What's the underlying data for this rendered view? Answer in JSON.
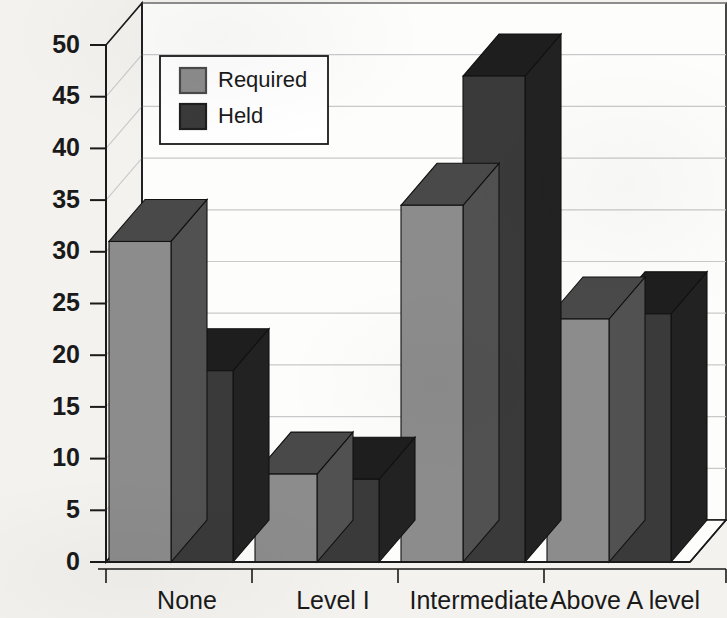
{
  "chart_data": {
    "type": "bar",
    "title": "",
    "subtitle": "",
    "xlabel": "",
    "ylabel": "",
    "categories": [
      "None",
      "Level I",
      "Intermediate",
      "Above A level"
    ],
    "series": [
      {
        "name": "Required",
        "values": [
          31,
          8.5,
          34.5,
          23.5
        ],
        "color": "#8c8c8c"
      },
      {
        "name": "Held",
        "values": [
          18.5,
          8,
          47,
          24
        ],
        "color": "#3a3a3a"
      }
    ],
    "ylim": [
      0,
      50
    ],
    "yticks": [
      0,
      5,
      10,
      15,
      20,
      25,
      30,
      35,
      40,
      45,
      50
    ],
    "ytick_labels": [
      "0",
      "5",
      "10",
      "15",
      "20",
      "25",
      "30",
      "35",
      "40",
      "45",
      "50"
    ],
    "grid": true,
    "grid_axis": "y",
    "legend_position": "upper left",
    "style": "3d-bar",
    "annotations": []
  },
  "legend": {
    "entries": [
      {
        "label": "Required",
        "swatch_face": "#8c8c8c",
        "swatch_edge": "#4a4a4a"
      },
      {
        "label": "Held",
        "swatch_face": "#3a3a3a",
        "swatch_edge": "#1e1e1e"
      }
    ]
  },
  "axes": {
    "y_ticks": [
      "50",
      "45",
      "40",
      "35",
      "30",
      "25",
      "20",
      "15",
      "10",
      "5",
      "0"
    ],
    "x_categories": [
      "None",
      "Level I",
      "Intermediate",
      "Above A level"
    ]
  },
  "colors": {
    "background": "#f3f2ef",
    "plot_background": "#fdfdfc",
    "axis_line": "#1a1a1a",
    "gridline": "#c9c9c9",
    "required_face": "#8c8c8c",
    "required_side": "#4e4e4e",
    "required_top": "#4a4a4a",
    "held_face": "#3a3a3a",
    "held_side": "#232323",
    "held_top": "#2b2b2b",
    "text": "#1a1a1a"
  }
}
